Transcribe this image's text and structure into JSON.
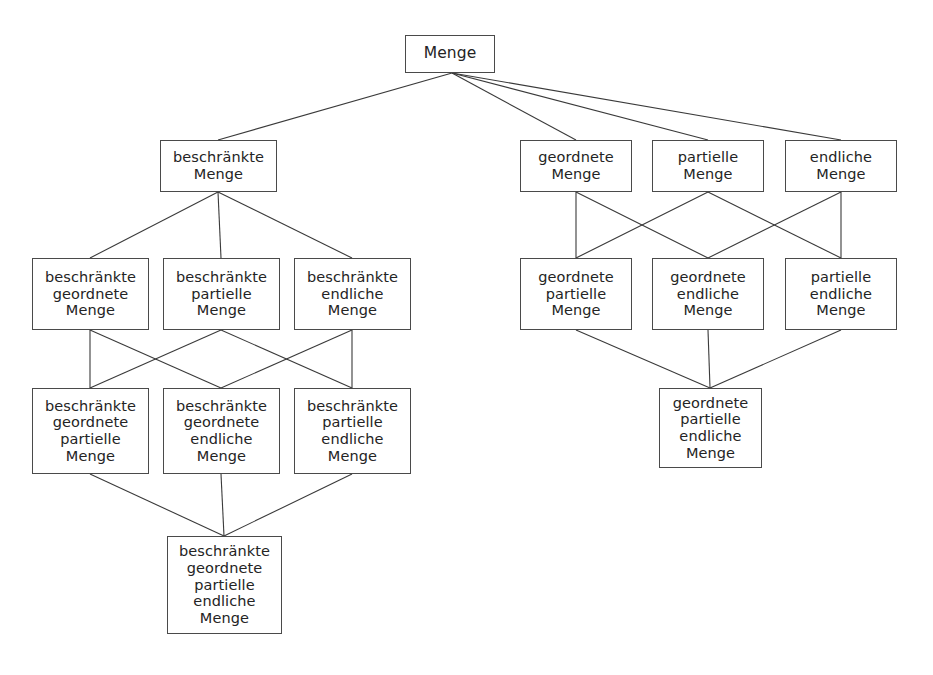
{
  "diagram": {
    "type": "lattice-diagram",
    "style": {
      "background": "#ffffff",
      "box_border_color": "#4a4a4a",
      "box_fill": "#ffffff",
      "edge_color": "#3a3a3a",
      "text_color": "#242424"
    },
    "nodes": [
      {
        "id": "menge",
        "label": "Menge",
        "x": 405,
        "y": 35,
        "w": 90,
        "h": 38
      },
      {
        "id": "beschraenkte",
        "label": "beschränkte\nMenge",
        "x": 160,
        "y": 140,
        "w": 117,
        "h": 52
      },
      {
        "id": "geordnete",
        "label": "geordnete\nMenge",
        "x": 520,
        "y": 140,
        "w": 112,
        "h": 52
      },
      {
        "id": "partielle",
        "label": "partielle\nMenge",
        "x": 652,
        "y": 140,
        "w": 112,
        "h": 52
      },
      {
        "id": "endliche",
        "label": "endliche\nMenge",
        "x": 785,
        "y": 140,
        "w": 112,
        "h": 52
      },
      {
        "id": "b-geordnete",
        "label": "beschränkte\ngeordnete\nMenge",
        "x": 32,
        "y": 258,
        "w": 117,
        "h": 72
      },
      {
        "id": "b-partielle",
        "label": "beschränkte\npartielle\nMenge",
        "x": 163,
        "y": 258,
        "w": 117,
        "h": 72
      },
      {
        "id": "b-endliche",
        "label": "beschränkte\nendliche\nMenge",
        "x": 294,
        "y": 258,
        "w": 117,
        "h": 72
      },
      {
        "id": "g-partielle",
        "label": "geordnete\npartielle\nMenge",
        "x": 520,
        "y": 258,
        "w": 112,
        "h": 72
      },
      {
        "id": "g-endliche",
        "label": "geordnete\nendliche\nMenge",
        "x": 652,
        "y": 258,
        "w": 112,
        "h": 72
      },
      {
        "id": "p-endliche",
        "label": "partielle\nendliche\nMenge",
        "x": 785,
        "y": 258,
        "w": 112,
        "h": 72
      },
      {
        "id": "b-g-partielle",
        "label": "beschränkte\ngeordnete\npartielle\nMenge",
        "x": 32,
        "y": 388,
        "w": 117,
        "h": 86
      },
      {
        "id": "b-g-endliche",
        "label": "beschränkte\ngeordnete\nendliche\nMenge",
        "x": 163,
        "y": 388,
        "w": 117,
        "h": 86
      },
      {
        "id": "b-p-endliche",
        "label": "beschränkte\npartielle\nendliche\nMenge",
        "x": 294,
        "y": 388,
        "w": 117,
        "h": 86
      },
      {
        "id": "g-p-endliche",
        "label": "geordnete\npartielle\nendliche\nMenge",
        "x": 659,
        "y": 388,
        "w": 103,
        "h": 80
      },
      {
        "id": "b-g-p-endliche",
        "label": "beschränkte\ngeordnete\npartielle\nendliche\nMenge",
        "x": 167,
        "y": 536,
        "w": 115,
        "h": 98
      }
    ],
    "edges": [
      {
        "from": "menge",
        "to": "beschraenkte",
        "x1": 452,
        "y1": 73,
        "x2": 218,
        "y2": 140
      },
      {
        "from": "menge",
        "to": "geordnete",
        "x1": 452,
        "y1": 73,
        "x2": 576,
        "y2": 140
      },
      {
        "from": "menge",
        "to": "partielle",
        "x1": 452,
        "y1": 73,
        "x2": 708,
        "y2": 140
      },
      {
        "from": "menge",
        "to": "endliche",
        "x1": 452,
        "y1": 73,
        "x2": 841,
        "y2": 140
      },
      {
        "from": "beschraenkte",
        "to": "b-geordnete",
        "x1": 218,
        "y1": 192,
        "x2": 90,
        "y2": 258
      },
      {
        "from": "beschraenkte",
        "to": "b-partielle",
        "x1": 218,
        "y1": 192,
        "x2": 221,
        "y2": 258
      },
      {
        "from": "beschraenkte",
        "to": "b-endliche",
        "x1": 218,
        "y1": 192,
        "x2": 352,
        "y2": 258
      },
      {
        "from": "geordnete",
        "to": "g-partielle",
        "x1": 576,
        "y1": 192,
        "x2": 576,
        "y2": 258
      },
      {
        "from": "geordnete",
        "to": "g-endliche",
        "x1": 576,
        "y1": 192,
        "x2": 708,
        "y2": 258
      },
      {
        "from": "partielle",
        "to": "g-partielle",
        "x1": 708,
        "y1": 192,
        "x2": 576,
        "y2": 258
      },
      {
        "from": "partielle",
        "to": "p-endliche",
        "x1": 708,
        "y1": 192,
        "x2": 841,
        "y2": 258
      },
      {
        "from": "endliche",
        "to": "g-endliche",
        "x1": 841,
        "y1": 192,
        "x2": 708,
        "y2": 258
      },
      {
        "from": "endliche",
        "to": "p-endliche",
        "x1": 841,
        "y1": 192,
        "x2": 841,
        "y2": 258
      },
      {
        "from": "b-geordnete",
        "to": "b-g-partielle",
        "x1": 90,
        "y1": 330,
        "x2": 90,
        "y2": 388
      },
      {
        "from": "b-geordnete",
        "to": "b-g-endliche",
        "x1": 90,
        "y1": 330,
        "x2": 221,
        "y2": 388
      },
      {
        "from": "b-partielle",
        "to": "b-g-partielle",
        "x1": 221,
        "y1": 330,
        "x2": 90,
        "y2": 388
      },
      {
        "from": "b-partielle",
        "to": "b-p-endliche",
        "x1": 221,
        "y1": 330,
        "x2": 352,
        "y2": 388
      },
      {
        "from": "b-endliche",
        "to": "b-g-endliche",
        "x1": 352,
        "y1": 330,
        "x2": 221,
        "y2": 388
      },
      {
        "from": "b-endliche",
        "to": "b-p-endliche",
        "x1": 352,
        "y1": 330,
        "x2": 352,
        "y2": 388
      },
      {
        "from": "g-partielle",
        "to": "g-p-endliche",
        "x1": 576,
        "y1": 330,
        "x2": 710,
        "y2": 388
      },
      {
        "from": "g-endliche",
        "to": "g-p-endliche",
        "x1": 708,
        "y1": 330,
        "x2": 710,
        "y2": 388
      },
      {
        "from": "p-endliche",
        "to": "g-p-endliche",
        "x1": 841,
        "y1": 330,
        "x2": 710,
        "y2": 388
      },
      {
        "from": "b-g-partielle",
        "to": "b-g-p-endliche",
        "x1": 90,
        "y1": 474,
        "x2": 224,
        "y2": 536
      },
      {
        "from": "b-g-endliche",
        "to": "b-g-p-endliche",
        "x1": 221,
        "y1": 474,
        "x2": 224,
        "y2": 536
      },
      {
        "from": "b-p-endliche",
        "to": "b-g-p-endliche",
        "x1": 352,
        "y1": 474,
        "x2": 224,
        "y2": 536
      }
    ]
  }
}
